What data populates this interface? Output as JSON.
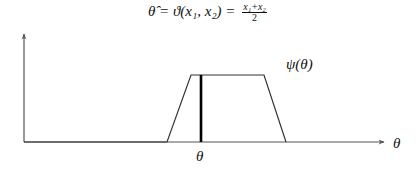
{
  "title": {
    "lhs": "θ̂ = ϑ(x",
    "full_text": "θ̂ = ϑ(x₁, x₂) = (x₁+x₂)/2",
    "prefix": "θ̂ = ϑ(x₁, x₂) = ",
    "frac_num": "x₁+x₂",
    "frac_den": "2"
  },
  "labels": {
    "curve": "ψ(θ)",
    "marker": "θ",
    "x_axis": "θ"
  },
  "colors": {
    "axis": "#555555",
    "curve": "#333333",
    "marker": "#000000"
  },
  "geometry": {
    "y_axis": {
      "x": 24,
      "y_top": 42,
      "y_bottom": 142
    },
    "x_axis": {
      "y": 142,
      "x_start": 24,
      "x_end": 384
    },
    "trapezoid": [
      [
        24,
        142
      ],
      [
        167,
        142
      ],
      [
        191,
        75
      ],
      [
        264,
        75
      ],
      [
        286,
        142
      ],
      [
        384,
        142
      ]
    ],
    "marker_line": {
      "x": 201,
      "y_top": 75,
      "y_bottom": 142
    }
  }
}
